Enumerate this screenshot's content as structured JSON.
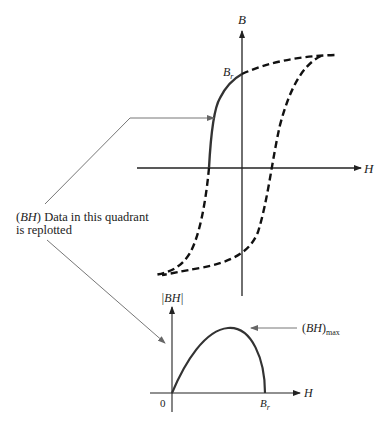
{
  "diagram": {
    "upper_plot": {
      "y_axis_label": "B",
      "x_axis_label": "H",
      "remanence_label": "B",
      "remanence_subscript": "r"
    },
    "annotation": {
      "line1_prefix": "(",
      "line1_var": "BH",
      "line1_suffix": ") Data in this quadrant",
      "line2": "is replotted"
    },
    "lower_plot": {
      "y_axis_label": "|BH|",
      "x_axis_label": "H",
      "origin_label": "0",
      "end_label": "B",
      "end_subscript": "r",
      "max_label_prefix": "(",
      "max_label_var": "BH",
      "max_label_suffix": ")",
      "max_label_subscript": "max"
    },
    "colors": {
      "curve": "#333333",
      "axis": "#222222",
      "leader": "#777777"
    }
  }
}
